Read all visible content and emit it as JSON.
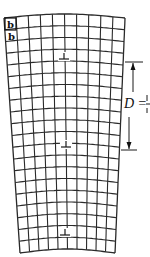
{
  "figure": {
    "type": "low-angle tilt grain boundary lattice",
    "burgers_labels": [
      "b",
      "b"
    ],
    "spacing_label": "D =",
    "spacing_fraction_cut": "b/θ",
    "dislocation_symbol": "⊥",
    "dislocation_count": 3,
    "dislocations": [
      {
        "x": 64,
        "y": 59
      },
      {
        "x": 66,
        "y": 147
      },
      {
        "x": 65,
        "y": 235
      }
    ],
    "grid": {
      "left_columns": 5,
      "right_columns": 5,
      "rows": 20,
      "top_y": 18,
      "bottom_y": 253,
      "top_left_x": 4,
      "top_right_x": 125,
      "bottom_left_x": 20,
      "bottom_right_x": 115,
      "color": "#2a2a2a"
    },
    "dimension": {
      "x": 133,
      "top_y": 62,
      "bottom_y": 150,
      "top_tick": [
        125,
        143
      ],
      "bottom_tick": [
        121,
        137
      ]
    }
  }
}
